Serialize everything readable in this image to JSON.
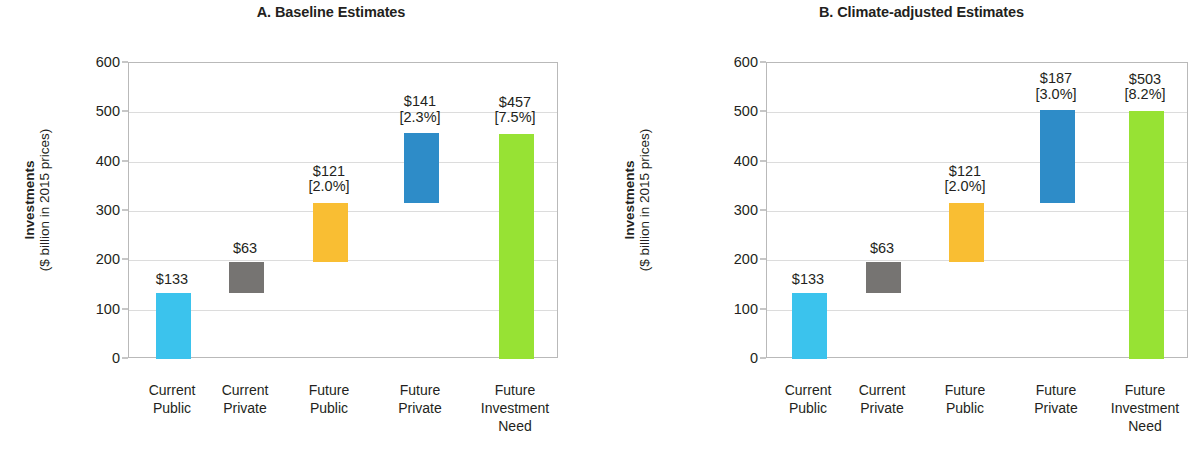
{
  "figure": {
    "axis_title_line1": "Investments",
    "axis_title_line2": "($ billion in 2015 prices)"
  },
  "chart_data": {
    "type": "bar",
    "subtype": "waterfall",
    "xlabel": "",
    "ylabel": "Investments ($ billion in 2015 prices)",
    "ylim": [
      0,
      600
    ],
    "ytick_values": [
      0,
      100,
      200,
      300,
      400,
      500,
      600
    ],
    "ytick_labels": [
      "0",
      "100",
      "200",
      "300",
      "400",
      "500",
      "600"
    ],
    "grid": true,
    "legend": "none",
    "categories": [
      "Current Public",
      "Current Private",
      "Future Public",
      "Future Private",
      "Future Investment Need"
    ],
    "category_lines": [
      [
        "Current",
        "Public"
      ],
      [
        "Current",
        "Private"
      ],
      [
        "Future",
        "Public"
      ],
      [
        "Future",
        "Private"
      ],
      [
        "Future",
        "Investment",
        "Need"
      ]
    ],
    "colors": {
      "current_public": "#3BC3ED",
      "current_private": "#767472",
      "future_public": "#F9BE33",
      "future_private": "#2E8CC8",
      "future_need": "#97E234",
      "gridline": "#dcdcdc",
      "axis": "#b9b9b9",
      "text": "#231f20"
    },
    "panels": [
      {
        "key": "a",
        "title": "A. Baseline Estimates",
        "bars": [
          {
            "category": "Current Public",
            "base": 0,
            "top": 133,
            "value": 133,
            "label": "$133",
            "pct": "",
            "color_key": "current_public"
          },
          {
            "category": "Current Private",
            "base": 133,
            "top": 196,
            "value": 63,
            "label": "$63",
            "pct": "",
            "color_key": "current_private"
          },
          {
            "category": "Future Public",
            "base": 196,
            "top": 317,
            "value": 121,
            "label": "$121",
            "pct": "[2.0%]",
            "color_key": "future_public"
          },
          {
            "category": "Future Private",
            "base": 317,
            "top": 458,
            "value": 141,
            "label": "$141",
            "pct": "[2.3%]",
            "color_key": "future_private"
          },
          {
            "category": "Future Investment Need",
            "base": 0,
            "top": 457,
            "value": 457,
            "label": "$457",
            "pct": "[7.5%]",
            "color_key": "future_need"
          }
        ]
      },
      {
        "key": "b",
        "title": "B. Climate-adjusted Estimates",
        "bars": [
          {
            "category": "Current Public",
            "base": 0,
            "top": 133,
            "value": 133,
            "label": "$133",
            "pct": "",
            "color_key": "current_public"
          },
          {
            "category": "Current Private",
            "base": 133,
            "top": 196,
            "value": 63,
            "label": "$63",
            "pct": "",
            "color_key": "current_private"
          },
          {
            "category": "Future Public",
            "base": 196,
            "top": 317,
            "value": 121,
            "label": "$121",
            "pct": "[2.0%]",
            "color_key": "future_public"
          },
          {
            "category": "Future Private",
            "base": 317,
            "top": 504,
            "value": 187,
            "label": "$187",
            "pct": "[3.0%]",
            "color_key": "future_private"
          },
          {
            "category": "Future Investment Need",
            "base": 0,
            "top": 503,
            "value": 503,
            "label": "$503",
            "pct": "[8.2%]",
            "color_key": "future_need"
          }
        ]
      }
    ]
  }
}
